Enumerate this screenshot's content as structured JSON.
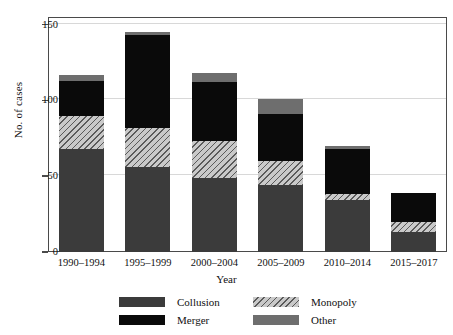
{
  "chart_data": {
    "type": "bar",
    "stacked": true,
    "title": "",
    "xlabel": "Year",
    "ylabel": "No. of cases",
    "ylim": [
      0,
      155
    ],
    "yticks": [
      0,
      50,
      100,
      150
    ],
    "ytick_labels": [
      "0",
      "50",
      "100",
      "150"
    ],
    "grid": "horizontal",
    "legend_position": "bottom",
    "categories": [
      "1990–1994",
      "1995–1999",
      "2000–2004",
      "2005–2009",
      "2010–2014",
      "2015–2017"
    ],
    "series": [
      {
        "name": "Collusion",
        "color": "#3b3b3b",
        "pattern": "solid",
        "values": [
          68,
          56,
          49,
          44,
          34,
          13
        ]
      },
      {
        "name": "Monopoly",
        "color": "#c9c9c9",
        "pattern": "hatch",
        "values": [
          22,
          26,
          24,
          16,
          4,
          7
        ]
      },
      {
        "name": "Merger",
        "color": "#0a0a0a",
        "pattern": "solid",
        "values": [
          23,
          61,
          39,
          31,
          30,
          19
        ]
      },
      {
        "name": "Other",
        "color": "#6e6e6e",
        "pattern": "solid",
        "values": [
          4,
          2,
          6,
          10,
          2,
          0
        ]
      }
    ],
    "totals": [
      117,
      145,
      118,
      101,
      70,
      39
    ]
  },
  "legend": {
    "items": [
      {
        "label": "Collusion",
        "swatch": "collusion"
      },
      {
        "label": "Monopoly",
        "swatch": "monopoly"
      },
      {
        "label": "Merger",
        "swatch": "merger"
      },
      {
        "label": "Other",
        "swatch": "other"
      }
    ]
  }
}
